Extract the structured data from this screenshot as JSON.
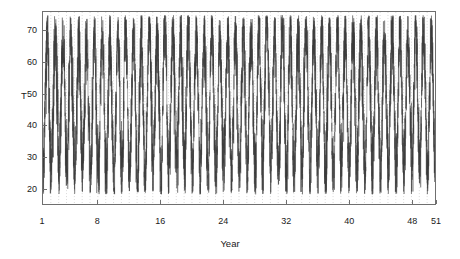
{
  "chart_data": {
    "type": "line",
    "title": "",
    "subtitle": "",
    "xlabel": "Year",
    "ylabel": "T",
    "xlim": [
      1,
      51
    ],
    "ylim": [
      15,
      76
    ],
    "grid": "vertical-dotted",
    "legend": "none",
    "x_ticks": [
      1,
      8,
      16,
      24,
      32,
      40,
      48,
      51
    ],
    "x_tick_labels": [
      "1",
      "8",
      "16",
      "24",
      "32",
      "40",
      "48",
      "51"
    ],
    "y_ticks": [
      20,
      30,
      40,
      50,
      60,
      70
    ],
    "y_tick_labels": [
      "20",
      "30",
      "40",
      "50",
      "60",
      "70"
    ],
    "series_name": "T",
    "series_color": "#3a3a3a",
    "annual_cycle": {
      "mean": 47.0,
      "amplitude": 17.5,
      "noise_sd": 6.0,
      "summer_peak_typical": 70,
      "winter_trough_typical": 26,
      "observed_max": 75,
      "observed_min": 18,
      "samples_per_year": 120
    },
    "series": [
      {
        "name": "T",
        "yearly_summer_peaks": [
          68,
          67,
          66,
          69,
          67,
          66,
          68,
          70,
          67,
          69,
          71,
          68,
          70,
          72,
          69,
          74,
          70,
          68,
          71,
          69,
          70,
          72,
          69,
          68,
          70,
          71,
          69,
          73,
          75,
          70,
          72,
          69,
          68,
          70,
          71,
          69,
          70,
          72,
          68,
          70,
          69,
          71,
          70,
          68,
          72,
          70,
          69,
          71,
          70,
          69,
          68
        ],
        "yearly_winter_troughs": [
          26,
          28,
          25,
          27,
          24,
          26,
          22,
          25,
          23,
          21,
          26,
          24,
          20,
          25,
          27,
          23,
          26,
          24,
          28,
          25,
          22,
          26,
          24,
          27,
          23,
          25,
          26,
          22,
          28,
          24,
          26,
          23,
          25,
          27,
          24,
          26,
          22,
          25,
          28,
          24,
          26,
          23,
          27,
          25,
          24,
          26,
          28,
          25,
          27,
          24,
          30
        ]
      }
    ]
  },
  "axes": {
    "y_label_text": "T",
    "x_label_text": "Year"
  }
}
